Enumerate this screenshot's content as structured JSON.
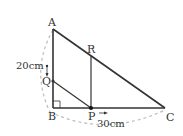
{
  "diagram": {
    "type": "geometry-figure",
    "points": {
      "A": "A",
      "B": "B",
      "C": "C",
      "P": "P",
      "Q": "Q",
      "R": "R"
    },
    "measurements": {
      "AB": "20cm",
      "BC": "30cm"
    },
    "colors": {
      "stroke": "#333333",
      "dashed": "#bbbbbb"
    },
    "annotations": {
      "right_angle_at": "B",
      "P_arrow_direction": "right"
    }
  }
}
